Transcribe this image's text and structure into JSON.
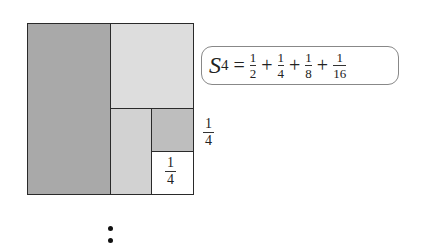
{
  "figure": {
    "regions": [
      {
        "name": "half",
        "value": "1/2",
        "color": "#a9a9a9"
      },
      {
        "name": "quarter",
        "value": "1/4",
        "color": "#dddddd"
      },
      {
        "name": "eighth",
        "value": "1/8",
        "color": "#d2d2d2"
      },
      {
        "name": "sixteenth",
        "value": "1/16",
        "color": "#bebebe"
      },
      {
        "name": "remainder",
        "value": "1/4",
        "color": "#ffffff"
      }
    ],
    "side_label": {
      "num": "1",
      "den": "4"
    },
    "inner_label": {
      "num": "1",
      "den": "4"
    }
  },
  "formula": {
    "symbol": "S",
    "subscript": "4",
    "equals": "=",
    "plus": "+",
    "terms": [
      {
        "num": "1",
        "den": "2"
      },
      {
        "num": "1",
        "den": "4"
      },
      {
        "num": "1",
        "den": "8"
      },
      {
        "num": "1",
        "den": "16"
      }
    ]
  },
  "continuation": "⋮"
}
